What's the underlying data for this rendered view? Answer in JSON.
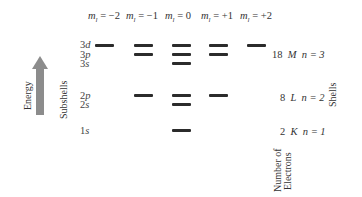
{
  "diagram": {
    "column_headers": [
      {
        "symbol": "m",
        "subscript": "l",
        "value": "= −2"
      },
      {
        "symbol": "m",
        "subscript": "l",
        "value": "= −1"
      },
      {
        "symbol": "m",
        "subscript": "l",
        "value": "= 0"
      },
      {
        "symbol": "m",
        "subscript": "l",
        "value": "= +1"
      },
      {
        "symbol": "m",
        "subscript": "l",
        "value": "= +2"
      }
    ],
    "axis": {
      "energy_label": "Energy",
      "subshells_label": "Subshells",
      "shells_label": "Shells",
      "electrons_label_line1": "Number of",
      "electrons_label_line2": "Electrons"
    },
    "subshells": [
      {
        "n": "3",
        "l": "d",
        "orbitals": 5
      },
      {
        "n": "3",
        "l": "p",
        "orbitals": 3
      },
      {
        "n": "3",
        "l": "s",
        "orbitals": 1
      },
      {
        "n": "2",
        "l": "p",
        "orbitals": 3
      },
      {
        "n": "2",
        "l": "s",
        "orbitals": 1
      },
      {
        "n": "1",
        "l": "s",
        "orbitals": 1
      }
    ],
    "shells": [
      {
        "electrons": "18",
        "letter": "M",
        "n_label": "n = 3"
      },
      {
        "electrons": "8",
        "letter": "L",
        "n_label": "n = 2"
      },
      {
        "electrons": "2",
        "letter": "K",
        "n_label": "n = 1"
      }
    ],
    "colors": {
      "bar": "#2b2b2b",
      "arrow": "#8c8c8c",
      "text": "#333333"
    }
  }
}
